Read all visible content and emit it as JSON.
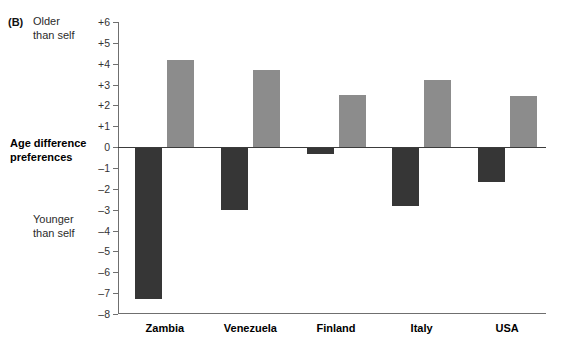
{
  "panel": {
    "letter": "(B)"
  },
  "annotations": {
    "top_note": "Older\nthan self",
    "axis_title": "Age difference\npreferences",
    "bottom_note": "Younger\nthan self"
  },
  "colors": {
    "dark_bar": "#363636",
    "light_bar": "#8c8c8c",
    "axis": "#6f6f6f",
    "zero_line": "#3b3b3b",
    "background": "#ffffff"
  },
  "chart_data": {
    "type": "bar",
    "title": "",
    "subtitle": "",
    "xlabel": "",
    "ylabel": "Age difference preferences",
    "ylim": [
      -8,
      6
    ],
    "ytick_values": [
      6,
      5,
      4,
      3,
      2,
      1,
      0,
      -1,
      -2,
      -3,
      -4,
      -5,
      -6,
      -7,
      -8
    ],
    "ytick_labels": [
      "+6",
      "+5",
      "+4",
      "+3",
      "+2",
      "+1",
      "0",
      "–1",
      "–2",
      "–3",
      "–4",
      "–5",
      "–6",
      "–7",
      "–8"
    ],
    "grid": false,
    "legend": "none",
    "categories": [
      "Zambia",
      "Venezuela",
      "Finland",
      "Italy",
      "USA"
    ],
    "series": [
      {
        "name": "Younger than self preference",
        "color": "#363636",
        "values": [
          -7.3,
          -3.0,
          -0.35,
          -2.8,
          -1.65
        ]
      },
      {
        "name": "Older than self preference",
        "color": "#8c8c8c",
        "values": [
          4.2,
          3.7,
          2.5,
          3.2,
          2.45
        ]
      }
    ],
    "annotations": [
      "Older than self",
      "Younger than self"
    ]
  }
}
